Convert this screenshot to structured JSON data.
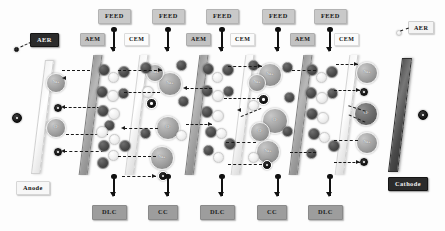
{
  "figure": {
    "caption": ""
  },
  "electrodes": {
    "anode": {
      "label": "Anode",
      "charge": "+",
      "charge_symbol": "+"
    },
    "cathode": {
      "label": "Cathode",
      "charge": "-",
      "charge_symbol": "-"
    }
  },
  "electrode_rinse": {
    "left_label": "AER",
    "right_label": "AER"
  },
  "feed_streams": [
    {
      "label": "FEED"
    },
    {
      "label": "FEED"
    },
    {
      "label": "FEED"
    },
    {
      "label": "FEED"
    },
    {
      "label": "FEED"
    }
  ],
  "membranes": [
    {
      "label": "AEM",
      "type": "anion-exchange"
    },
    {
      "label": "CEM",
      "type": "cation-exchange"
    },
    {
      "label": "AEM",
      "type": "anion-exchange"
    },
    {
      "label": "CEM",
      "type": "cation-exchange"
    },
    {
      "label": "AEM",
      "type": "anion-exchange"
    },
    {
      "label": "CEM",
      "type": "cation-exchange"
    },
    {
      "label": "AEM",
      "type": "anion-exchange"
    },
    {
      "label": "CEM",
      "type": "cation-exchange"
    }
  ],
  "outlet_streams": [
    {
      "label": "DLC",
      "meaning": "dilute compartment"
    },
    {
      "label": "CC",
      "meaning": "concentrate compartment"
    },
    {
      "label": "DLC",
      "meaning": "dilute compartment"
    },
    {
      "label": "CC",
      "meaning": "concentrate compartment"
    },
    {
      "label": "DLC",
      "meaning": "dilute compartment"
    }
  ],
  "ions": {
    "cation_label": "Na+",
    "anion_label": "Cl-",
    "positive_symbol": "+",
    "negative_symbol": "-"
  },
  "colors": {
    "cation_fill": "#9f9f9f",
    "anion_fill": "#6a6a6a",
    "aem_fill": "#a8a8a8",
    "cem_fill": "#f2f2f2",
    "cathode_fill": "#4a4a4a",
    "anode_fill": "#f2f2f2",
    "feed_badge": "#c9c9c9",
    "outlet_badge": "#9d9d9d",
    "dark_badge": "#2b2b2b"
  }
}
